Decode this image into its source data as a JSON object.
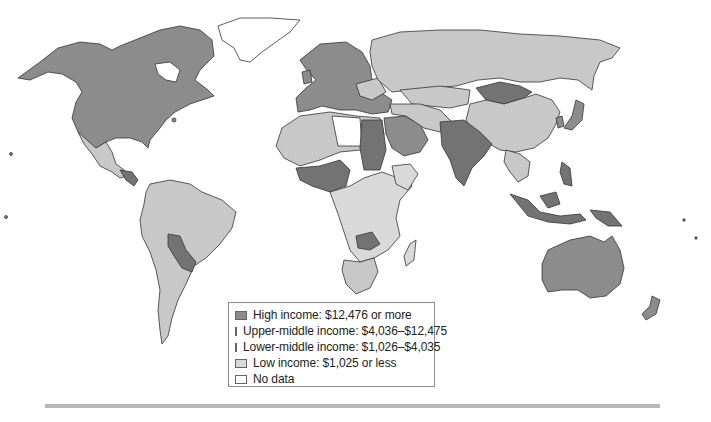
{
  "map": {
    "title": "World income classification by GNI per capita",
    "colors": {
      "high": "#8c8c8c",
      "upper_middle": "#c8c8c8",
      "lower_middle": "#7a7a7a",
      "low": "#d6d6d6",
      "no_data": "#ffffff",
      "border": "#333333",
      "rule": "#b8b8b8"
    }
  },
  "legend": {
    "items": [
      {
        "key": "high",
        "label": "High income: $12,476 or more",
        "color": "#8c8c8c"
      },
      {
        "key": "upper_middle",
        "label": "Upper-middle income: $4,036–$12,475",
        "color": "#c8c8c8"
      },
      {
        "key": "lower_middle",
        "label": "Lower-middle income: $1,026–$4,035",
        "color": "#737373"
      },
      {
        "key": "low",
        "label": "Low income: $1,025 or less",
        "color": "#d9d9d9"
      },
      {
        "key": "no_data",
        "label": "No data",
        "color": "#ffffff"
      }
    ]
  }
}
